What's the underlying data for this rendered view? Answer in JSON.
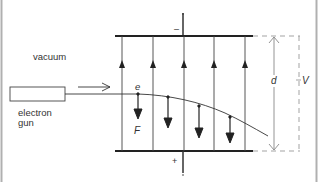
{
  "diagram": {
    "labels": {
      "vacuum": "vacuum",
      "gun_line1": "electron",
      "gun_line2": "gun",
      "electron": "e",
      "force": "F",
      "separation": "d",
      "voltage": "V",
      "top_plate_sign": "–",
      "bottom_plate_sign": "+"
    },
    "components": [
      {
        "name": "electron-gun",
        "shape": "rectangle"
      },
      {
        "name": "top-plate",
        "polarity": "negative"
      },
      {
        "name": "bottom-plate",
        "polarity": "positive"
      },
      {
        "name": "field-lines",
        "count": 5,
        "direction": "upward"
      },
      {
        "name": "electron-path",
        "shape": "parabolic curve bending downward"
      },
      {
        "name": "force-arrows",
        "count": 4,
        "direction": "downward"
      },
      {
        "name": "dimension-d",
        "meaning": "plate separation"
      },
      {
        "name": "dimension-V",
        "meaning": "potential difference"
      }
    ],
    "colors": {
      "line": "#333333",
      "frame": "#aaaaaa",
      "dashed": "#999999",
      "background": "#ffffff"
    }
  }
}
